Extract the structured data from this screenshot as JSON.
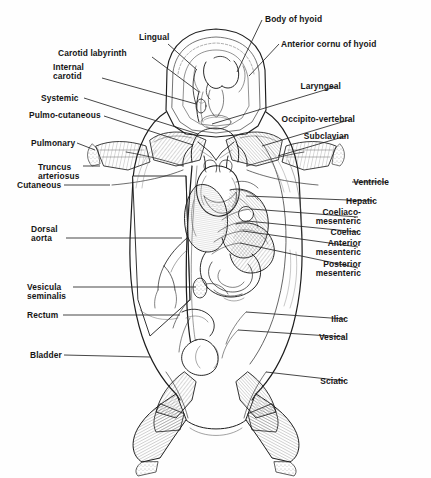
{
  "figure": {
    "style": "engraved line drawing, black ink on white",
    "background_color": "#fefefe",
    "ink_color": "#1a1a1a",
    "leader_line_color": "#2a2a2a",
    "width": 431,
    "height": 478
  },
  "labels": {
    "left": [
      {
        "id": "carotid-labyrinth",
        "text": "Carotid labyrinth",
        "lines": [
          "Carotid labyrinth"
        ],
        "x": 58,
        "y": 49,
        "align": "left",
        "leader": {
          "x1": 152,
          "y1": 57,
          "x2": 199,
          "y2": 92
        }
      },
      {
        "id": "internal-carotid",
        "text": "Internal carotid",
        "lines": [
          "Internal",
          "carotid"
        ],
        "x": 53,
        "y": 63,
        "align": "left",
        "leader": {
          "x1": 102,
          "y1": 78,
          "x2": 196,
          "y2": 104
        }
      },
      {
        "id": "systemic",
        "text": "Systemic",
        "lines": [
          "Systemic"
        ],
        "x": 41,
        "y": 94,
        "align": "left",
        "leader": {
          "x1": 84,
          "y1": 98,
          "x2": 198,
          "y2": 134
        }
      },
      {
        "id": "pulmo-cutaneous",
        "text": "Pulmo-cutaneous",
        "lines": [
          "Pulmo-cutaneous"
        ],
        "x": 29,
        "y": 111,
        "align": "left",
        "leader": {
          "x1": 104,
          "y1": 116,
          "x2": 193,
          "y2": 145
        }
      },
      {
        "id": "pulmonary",
        "text": "Pulmonary",
        "lines": [
          "Pulmonary"
        ],
        "x": 31,
        "y": 139,
        "align": "left",
        "leader": {
          "x1": 77,
          "y1": 143,
          "x2": 95,
          "y2": 150
        }
      },
      {
        "id": "truncus-arteriosus",
        "text": "Truncus arteriosus",
        "lines": [
          "Truncus",
          "arteriosus"
        ],
        "x": 38,
        "y": 163,
        "align": "left",
        "leader": {
          "x1": 83,
          "y1": 166,
          "x2": 100,
          "y2": 166
        }
      },
      {
        "id": "cutaneous",
        "text": "Cutaneous",
        "lines": [
          "Cutaneous"
        ],
        "x": 17,
        "y": 181,
        "align": "left",
        "leader": {
          "x1": 64,
          "y1": 185,
          "x2": 110,
          "y2": 185
        }
      },
      {
        "id": "dorsal-aorta",
        "text": "Dorsal aorta",
        "lines": [
          "Dorsal",
          "aorta"
        ],
        "x": 31,
        "y": 225,
        "align": "left",
        "leader": {
          "x1": 66,
          "y1": 238,
          "x2": 182,
          "y2": 238
        }
      },
      {
        "id": "vesicula-seminalis",
        "text": "Vesicula seminalis",
        "lines": [
          "Vesicula",
          "seminalis"
        ],
        "x": 27,
        "y": 283,
        "align": "left",
        "leader": {
          "x1": 73,
          "y1": 287,
          "x2": 196,
          "y2": 287
        }
      },
      {
        "id": "rectum",
        "text": "Rectum",
        "lines": [
          "Rectum"
        ],
        "x": 27,
        "y": 311,
        "align": "left",
        "leader": {
          "x1": 63,
          "y1": 315,
          "x2": 180,
          "y2": 315
        }
      },
      {
        "id": "bladder",
        "text": "Bladder",
        "lines": [
          "Bladder"
        ],
        "x": 30,
        "y": 351,
        "align": "left",
        "leader": {
          "x1": 64,
          "y1": 355,
          "x2": 150,
          "y2": 357
        }
      }
    ],
    "top": [
      {
        "id": "lingual",
        "text": "Lingual",
        "lines": [
          "Lingual"
        ],
        "x": 139,
        "y": 33,
        "align": "left",
        "leader": {
          "x1": 168,
          "y1": 44,
          "x2": 197,
          "y2": 70
        }
      },
      {
        "id": "body-of-hyoid",
        "text": "Body of hyoid",
        "lines": [
          "Body of hyoid"
        ],
        "x": 265,
        "y": 15,
        "align": "left",
        "leader": {
          "x1": 262,
          "y1": 20,
          "x2": 237,
          "y2": 72
        }
      },
      {
        "id": "anterior-cornu-of-hyoid",
        "text": "Anterior cornu of hyoid",
        "lines": [
          "Anterior cornu of hyoid"
        ],
        "x": 281,
        "y": 40,
        "align": "left",
        "leader": {
          "x1": 279,
          "y1": 44,
          "x2": 249,
          "y2": 76
        }
      }
    ],
    "right": [
      {
        "id": "laryngeal",
        "text": "Laryngeal",
        "lines": [
          "Laryngeal"
        ],
        "x": 341,
        "y": 82,
        "align": "right",
        "leader": {
          "x1": 338,
          "y1": 86,
          "x2": 212,
          "y2": 124
        }
      },
      {
        "id": "occipito-vertebral",
        "text": "Occipito-vertebral",
        "lines": [
          "Occipito-vertebral"
        ],
        "x": 355,
        "y": 115,
        "align": "right",
        "leader": {
          "x1": 352,
          "y1": 119,
          "x2": 262,
          "y2": 146
        }
      },
      {
        "id": "subclavian",
        "text": "Subclavian",
        "lines": [
          "Subclavian"
        ],
        "x": 349,
        "y": 132,
        "align": "right",
        "leader": {
          "x1": 346,
          "y1": 136,
          "x2": 278,
          "y2": 156
        }
      },
      {
        "id": "ventricle",
        "text": "Ventricle",
        "lines": [
          "Ventricle"
        ],
        "x": 389,
        "y": 178,
        "align": "right",
        "leader": {
          "x1": 386,
          "y1": 182,
          "x2": 352,
          "y2": 182
        }
      },
      {
        "id": "hepatic",
        "text": "Hepatic",
        "lines": [
          "Hepatic"
        ],
        "x": 377,
        "y": 197,
        "align": "right",
        "leader": {
          "x1": 374,
          "y1": 201,
          "x2": 246,
          "y2": 196
        }
      },
      {
        "id": "coeliaco-mesenteric",
        "text": "Coeliaco-mesenteric",
        "lines": [
          "Coeliaco-",
          "mesenteric"
        ],
        "x": 361,
        "y": 208,
        "align": "right",
        "leader": {
          "x1": 358,
          "y1": 217,
          "x2": 251,
          "y2": 209
        }
      },
      {
        "id": "coeliac",
        "text": "Coeliac",
        "lines": [
          "Coeliac"
        ],
        "x": 361,
        "y": 228,
        "align": "right",
        "leader": {
          "x1": 358,
          "y1": 232,
          "x2": 247,
          "y2": 221
        }
      },
      {
        "id": "anterior-mesenteric",
        "text": "Anterior mesenteric",
        "lines": [
          "Anterior",
          "mesenteric"
        ],
        "x": 361,
        "y": 239,
        "align": "right",
        "leader": {
          "x1": 358,
          "y1": 247,
          "x2": 243,
          "y2": 231
        }
      },
      {
        "id": "posterior-mesenteric",
        "text": "Posterior mesenteric",
        "lines": [
          "Posterior",
          "mesenteric"
        ],
        "x": 361,
        "y": 260,
        "align": "right",
        "leader": {
          "x1": 358,
          "y1": 268,
          "x2": 240,
          "y2": 243
        }
      },
      {
        "id": "iliac",
        "text": "Iliac",
        "lines": [
          "Iliac"
        ],
        "x": 348,
        "y": 315,
        "align": "right",
        "leader": {
          "x1": 345,
          "y1": 319,
          "x2": 246,
          "y2": 312
        }
      },
      {
        "id": "vesical",
        "text": "Vesical",
        "lines": [
          "Vesical"
        ],
        "x": 348,
        "y": 333,
        "align": "right",
        "leader": {
          "x1": 345,
          "y1": 337,
          "x2": 238,
          "y2": 330
        }
      },
      {
        "id": "sciatic",
        "text": "Sciatic",
        "lines": [
          "Sciatic"
        ],
        "x": 348,
        "y": 377,
        "align": "right",
        "leader": {
          "x1": 345,
          "y1": 381,
          "x2": 266,
          "y2": 372
        }
      }
    ]
  }
}
